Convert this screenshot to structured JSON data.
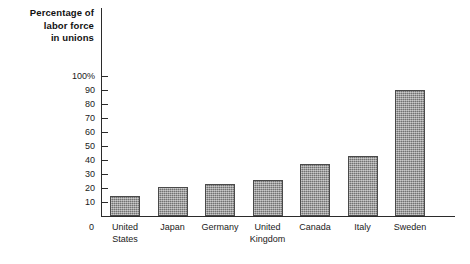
{
  "chart_data": {
    "type": "bar",
    "title": "Percentage of labor force in unions",
    "title_lines": [
      "Percentage of",
      "labor force",
      "in unions"
    ],
    "xlabel": "",
    "ylabel": "Percentage of labor force in unions",
    "ylim": [
      0,
      100
    ],
    "grid": false,
    "legend": "none",
    "ytick_labels": [
      "100%",
      "90",
      "80",
      "70",
      "60",
      "50",
      "40",
      "30",
      "20",
      "10",
      "0"
    ],
    "ytick_values": [
      100,
      90,
      80,
      70,
      60,
      50,
      40,
      30,
      20,
      10,
      0
    ],
    "categories": [
      "United States",
      "Japan",
      "Germany",
      "United Kingdom",
      "Canada",
      "Italy",
      "Sweden"
    ],
    "category_lines": [
      [
        "United",
        "States"
      ],
      [
        "Japan"
      ],
      [
        "Germany"
      ],
      [
        "United",
        "Kingdom"
      ],
      [
        "Canada"
      ],
      [
        "Italy"
      ],
      [
        "Sweden"
      ]
    ],
    "values": [
      14,
      21,
      23,
      26,
      37,
      43,
      90
    ],
    "bar_color": "#8d8d8d",
    "bar_edge_color": "#4a4a4a",
    "axis_color": "#2b2b2b",
    "background_color": "#ffffff"
  }
}
